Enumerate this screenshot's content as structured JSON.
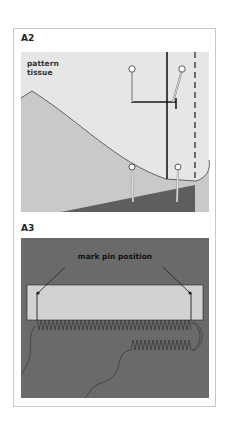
{
  "figure": {
    "panels": [
      {
        "id": "A2",
        "label": "A2",
        "annotation": "pattern tissue",
        "annotation_lines": [
          "pattern",
          "tissue"
        ],
        "colors": {
          "background": "#e6e6e6",
          "tissue_fill": "#c9c9c9",
          "fabric_dark": "#5e5e5e",
          "line": "#222222"
        }
      },
      {
        "id": "A3",
        "label": "A3",
        "annotation": "mark pin position",
        "colors": {
          "background": "#6a6a6a",
          "strip_fill": "#d2d2d2",
          "line": "#1e1e1e"
        }
      }
    ]
  }
}
